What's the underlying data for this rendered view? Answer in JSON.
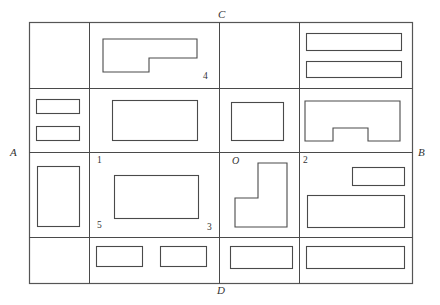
{
  "diagram": {
    "stroke_color": "#4a4a4a",
    "frame_color": "#555555",
    "background": "#ffffff",
    "frame": {
      "x": 29,
      "y": 22,
      "width": 383,
      "height": 261
    },
    "grid": {
      "column_dividers": [
        89,
        219,
        299
      ],
      "row_dividers": [
        88,
        152,
        237
      ]
    },
    "corner_labels": [
      {
        "text": "C",
        "x": 218,
        "y": 8
      },
      {
        "text": "A",
        "x": 10,
        "y": 146
      },
      {
        "text": "B",
        "x": 418,
        "y": 146
      },
      {
        "text": "D",
        "x": 217,
        "y": 284
      }
    ],
    "point_labels": [
      {
        "text": "4",
        "x": 203,
        "y": 71
      },
      {
        "text": "1",
        "x": 97,
        "y": 155
      },
      {
        "text": "O",
        "x": 232,
        "y": 155
      },
      {
        "text": "2",
        "x": 303,
        "y": 155
      },
      {
        "text": "5",
        "x": 97,
        "y": 220
      },
      {
        "text": "3",
        "x": 207,
        "y": 222
      }
    ],
    "shapes": [
      {
        "name": "cell-r1c2-l-shape",
        "type": "polygon",
        "points": "103,39 197,39 197,58 149,58 149,72 103,72"
      },
      {
        "name": "cell-r1c4-rect-top",
        "type": "rect",
        "x": 306,
        "y": 33,
        "width": 95,
        "height": 17
      },
      {
        "name": "cell-r1c4-rect-bottom",
        "type": "rect",
        "x": 306,
        "y": 61,
        "width": 95,
        "height": 16
      },
      {
        "name": "cell-r2c1-rect-top",
        "type": "rect",
        "x": 36,
        "y": 99,
        "width": 43,
        "height": 14
      },
      {
        "name": "cell-r2c1-rect-bottom",
        "type": "rect",
        "x": 36,
        "y": 126,
        "width": 43,
        "height": 14
      },
      {
        "name": "cell-r2c2-rect",
        "type": "rect",
        "x": 112,
        "y": 100,
        "width": 85,
        "height": 40
      },
      {
        "name": "cell-r2c3-rect",
        "type": "rect",
        "x": 231,
        "y": 102,
        "width": 52,
        "height": 38
      },
      {
        "name": "cell-r2c4-notched",
        "type": "polygon",
        "points": "305,101 400,101 400,141 368,141 368,128 333,128 333,141 305,141"
      },
      {
        "name": "cell-r3c1-rect",
        "type": "rect",
        "x": 37,
        "y": 166,
        "width": 42,
        "height": 60
      },
      {
        "name": "cell-r3c2-rect",
        "type": "rect",
        "x": 114,
        "y": 175,
        "width": 84,
        "height": 43
      },
      {
        "name": "cell-r3c3-reverse-l",
        "type": "polygon",
        "points": "258,163 287,163 287,227 235,227 235,198 258,198"
      },
      {
        "name": "cell-r3c4-rect-top",
        "type": "rect",
        "x": 352,
        "y": 167,
        "width": 52,
        "height": 18
      },
      {
        "name": "cell-r3c4-rect-bottom",
        "type": "rect",
        "x": 307,
        "y": 195,
        "width": 97,
        "height": 32
      },
      {
        "name": "cell-r4c2-rect-left",
        "type": "rect",
        "x": 96,
        "y": 246,
        "width": 46,
        "height": 20
      },
      {
        "name": "cell-r4c2-rect-right",
        "type": "rect",
        "x": 160,
        "y": 246,
        "width": 46,
        "height": 20
      },
      {
        "name": "cell-r4c3-rect",
        "type": "rect",
        "x": 230,
        "y": 246,
        "width": 62,
        "height": 22
      },
      {
        "name": "cell-r4c4-rect",
        "type": "rect",
        "x": 306,
        "y": 246,
        "width": 98,
        "height": 22
      }
    ]
  }
}
